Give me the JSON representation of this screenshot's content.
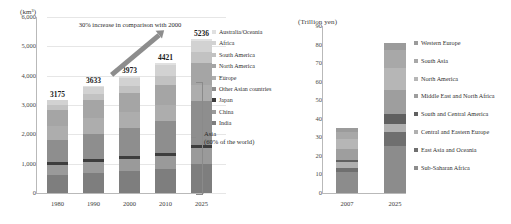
{
  "chart_data": [
    {
      "id": "water-demand",
      "type": "bar",
      "stacked": true,
      "title": "",
      "unit_label": "(km³)",
      "xlabel": "",
      "ylabel": "",
      "ylim": [
        0,
        6000
      ],
      "yticks": [
        "0",
        "1,000",
        "2,000",
        "3,000",
        "4,000",
        "5,000",
        "6,000"
      ],
      "ytick_values": [
        0,
        1000,
        2000,
        3000,
        4000,
        5000,
        6000
      ],
      "grid": true,
      "legend_position": "right",
      "categories": [
        "1980",
        "1990",
        "2000",
        "2010",
        "2025"
      ],
      "totals": [
        3175,
        3633,
        3973,
        4421,
        5236
      ],
      "total_labels": [
        "3175",
        "3633",
        "3973",
        "4421",
        "5236"
      ],
      "series": [
        {
          "name": "India",
          "color": "#7e7e7e",
          "values": [
            620,
            690,
            740,
            800,
            980
          ]
        },
        {
          "name": "China",
          "color": "#9a9a9a",
          "values": [
            330,
            380,
            420,
            470,
            560
          ]
        },
        {
          "name": "Japan",
          "color": "#3d3d3d",
          "values": [
            95,
            95,
            95,
            95,
            95
          ]
        },
        {
          "name": "Other Asian countries",
          "color": "#8e8e8e",
          "values": [
            760,
            860,
            950,
            1100,
            1500
          ]
        },
        {
          "name": "Europe",
          "color": "#adadad",
          "values": [
            480,
            530,
            540,
            540,
            560
          ]
        },
        {
          "name": "North America",
          "color": "#a5a5a5",
          "values": [
            560,
            620,
            650,
            690,
            730
          ]
        },
        {
          "name": "South America",
          "color": "#c2c2c2",
          "values": [
            170,
            210,
            250,
            300,
            380
          ]
        },
        {
          "name": "Africa",
          "color": "#d2d2d2",
          "values": [
            140,
            220,
            290,
            380,
            390
          ]
        },
        {
          "name": "Australia/Oceania",
          "color": "#e0e0e0",
          "values": [
            20,
            28,
            38,
            46,
            41
          ]
        }
      ],
      "legend_entries": [
        {
          "label": "Australia/Oceania",
          "color": "#e0e0e0"
        },
        {
          "label": "Africa",
          "color": "#d2d2d2"
        },
        {
          "label": "South America",
          "color": "#c2c2c2"
        },
        {
          "label": "North America",
          "color": "#a5a5a5"
        },
        {
          "label": "Europe",
          "color": "#adadad"
        },
        {
          "label": "Other Asian countries",
          "color": "#8e8e8e"
        },
        {
          "label": "Japan",
          "color": "#3d3d3d"
        },
        {
          "label": "China",
          "color": "#9a9a9a"
        },
        {
          "label": "India",
          "color": "#7e7e7e"
        }
      ],
      "annotations": [
        {
          "id": "growth-note",
          "text": "30% increase in comparison with 2000"
        },
        {
          "id": "asia-note-line1",
          "text": "Asia"
        },
        {
          "id": "asia-note-line2",
          "text": "(60% of the world)"
        }
      ]
    },
    {
      "id": "water-market",
      "type": "bar",
      "stacked": true,
      "title": "",
      "unit_label": "(Trillion yen)",
      "xlabel": "",
      "ylabel": "",
      "ylim": [
        0,
        90
      ],
      "yticks": [
        "0",
        "10",
        "20",
        "30",
        "40",
        "50",
        "60",
        "70",
        "80",
        "90"
      ],
      "ytick_values": [
        0,
        10,
        20,
        30,
        40,
        50,
        60,
        70,
        80,
        90
      ],
      "grid": false,
      "legend_position": "right",
      "categories": [
        "2007",
        "2025"
      ],
      "totals": [
        35,
        81
      ],
      "series": [
        {
          "name": "Sub-Saharan Africa",
          "color": "#8c8c8c",
          "values": [
            11.5,
            25.5
          ]
        },
        {
          "name": "East Asia and Oceania",
          "color": "#6f6f6f",
          "values": [
            2.0,
            7.5
          ]
        },
        {
          "name": "Central and Eastern Europe",
          "color": "#b0b0b0",
          "values": [
            3.0,
            4.0
          ]
        },
        {
          "name": "South and Central America",
          "color": "#606060",
          "values": [
            1.5,
            5.5
          ]
        },
        {
          "name": "Middle East and North Africa",
          "color": "#9e9e9e",
          "values": [
            5.5,
            13.0
          ]
        },
        {
          "name": "North America",
          "color": "#b6b6b6",
          "values": [
            5.5,
            12.0
          ]
        },
        {
          "name": "South Asia",
          "color": "#a8a8a8",
          "values": [
            4.0,
            9.5
          ]
        },
        {
          "name": "Western Europe",
          "color": "#9b9b9b",
          "values": [
            2.0,
            4.0
          ]
        }
      ],
      "legend_entries": [
        {
          "label": "Western Europe",
          "color": "#9b9b9b"
        },
        {
          "label": "South Asia",
          "color": "#a8a8a8"
        },
        {
          "label": "North America",
          "color": "#b6b6b6"
        },
        {
          "label": "Middle East and North Africa",
          "color": "#9e9e9e"
        },
        {
          "label": "South and Central America",
          "color": "#606060"
        },
        {
          "label": "Central and Eastern Europe",
          "color": "#b0b0b0"
        },
        {
          "label": "East Asia and Oceania",
          "color": "#6f6f6f"
        },
        {
          "label": "Sub-Saharan Africa",
          "color": "#8c8c8c"
        }
      ]
    }
  ]
}
